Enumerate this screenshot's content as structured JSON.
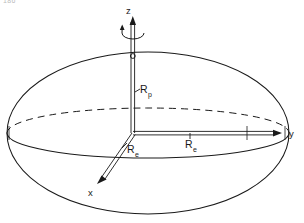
{
  "figure": {
    "page_number": "186",
    "background_color": "#ffffff",
    "line_color": "#1a1a1a",
    "axes": [
      {
        "id": "z",
        "label": "z",
        "direction": "up",
        "icon": "arrow-up-icon"
      },
      {
        "id": "y",
        "label": "y",
        "direction": "right",
        "icon": "arrow-right-icon"
      },
      {
        "id": "x",
        "label": "x",
        "direction": "down-left",
        "icon": "arrow-down-left-icon"
      }
    ],
    "radii": [
      {
        "id": "polar",
        "label": "R",
        "subscript": "p",
        "axis": "z"
      },
      {
        "id": "equatorial_x",
        "label": "R",
        "subscript": "e",
        "axis": "x"
      },
      {
        "id": "equatorial_y",
        "label": "R",
        "subscript": "e",
        "axis": "y"
      }
    ],
    "rotation_symbol": {
      "name": "rotation-arc-icon",
      "description": "curved arrow around z axis"
    },
    "pole_marker": {
      "name": "north-pole-marker",
      "description": "small circle where z axis meets surface"
    },
    "equator": {
      "front_style": "solid",
      "back_style": "dashed"
    }
  }
}
